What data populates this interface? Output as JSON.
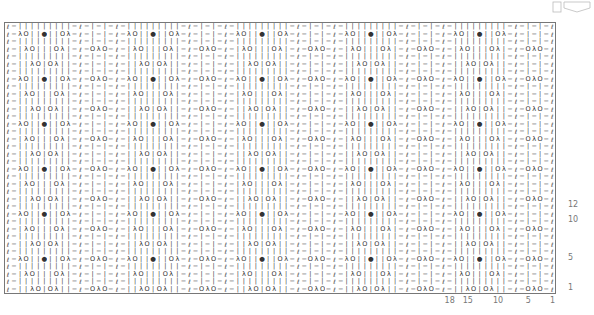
{
  "chart": {
    "repeat_width": 18,
    "repeat_rows": 12,
    "total_cols": 91,
    "total_rows": 36,
    "symbols": {
      "L": "ℓ",
      "p": "−",
      "k": "|",
      "yo": "O",
      "k2tog": "λ",
      "ssk": "λ",
      "bobble": "●",
      "cdd": "λ"
    },
    "row_panels": [
      {
        "row": 1,
        "panel": [
          "k",
          "k",
          "k2tog",
          "yo",
          "k",
          "yo",
          "ssk",
          "k",
          "k"
        ],
        "mid": [
          "yo",
          "cdd",
          "yo"
        ]
      },
      {
        "row": 2,
        "panel": [
          "k",
          "k",
          "k",
          "k",
          "k",
          "k",
          "k",
          "k",
          "k"
        ],
        "mid": [
          "k",
          "p",
          "k"
        ]
      },
      {
        "row": 3,
        "panel": [
          "k",
          "k2tog",
          "yo",
          "k",
          "k",
          "k",
          "yo",
          "ssk",
          "k"
        ],
        "mid": [
          "k",
          "p",
          "k"
        ]
      },
      {
        "row": 4,
        "panel": [
          "k",
          "k",
          "k",
          "k",
          "k",
          "k",
          "k",
          "k",
          "k"
        ],
        "mid": [
          "k",
          "p",
          "k"
        ]
      },
      {
        "row": 5,
        "panel": [
          "k2tog",
          "yo",
          "k",
          "k",
          "bobble",
          "k",
          "k",
          "yo",
          "ssk"
        ],
        "mid": [
          "yo",
          "cdd",
          "yo"
        ]
      },
      {
        "row": 6,
        "panel": [
          "k",
          "k",
          "k",
          "k",
          "k",
          "k",
          "k",
          "k",
          "k"
        ],
        "mid": [
          "k",
          "p",
          "k"
        ]
      },
      {
        "row": 7,
        "panel": [
          "k",
          "k",
          "k2tog",
          "yo",
          "k",
          "yo",
          "ssk",
          "k",
          "k"
        ],
        "mid": [
          "k",
          "p",
          "k"
        ]
      },
      {
        "row": 8,
        "panel": [
          "k",
          "k",
          "k",
          "k",
          "k",
          "k",
          "k",
          "k",
          "k"
        ],
        "mid": [
          "k",
          "p",
          "k"
        ]
      },
      {
        "row": 9,
        "panel": [
          "k",
          "k2tog",
          "yo",
          "k",
          "k",
          "k",
          "yo",
          "ssk",
          "k"
        ],
        "mid": [
          "yo",
          "cdd",
          "yo"
        ]
      },
      {
        "row": 10,
        "panel": [
          "k",
          "k",
          "k",
          "k",
          "k",
          "k",
          "k",
          "k",
          "k"
        ],
        "mid": [
          "k",
          "p",
          "k"
        ]
      },
      {
        "row": 11,
        "panel": [
          "k2tog",
          "yo",
          "k",
          "k",
          "bobble",
          "k",
          "k",
          "yo",
          "ssk"
        ],
        "mid": [
          "k",
          "p",
          "k"
        ]
      },
      {
        "row": 12,
        "panel": [
          "k",
          "k",
          "k",
          "k",
          "k",
          "k",
          "k",
          "k",
          "k"
        ],
        "mid": [
          "k",
          "p",
          "k"
        ]
      }
    ],
    "row_labels": [
      {
        "label": "1",
        "row": 1
      },
      {
        "label": "5",
        "row": 5
      },
      {
        "label": "10",
        "row": 10
      },
      {
        "label": "12",
        "row": 12
      }
    ],
    "col_labels": [
      {
        "label": "18",
        "col": 18
      },
      {
        "label": "15",
        "col": 15
      },
      {
        "label": "10",
        "col": 10
      },
      {
        "label": "5",
        "col": 5
      },
      {
        "label": "1",
        "col": 1
      }
    ]
  }
}
